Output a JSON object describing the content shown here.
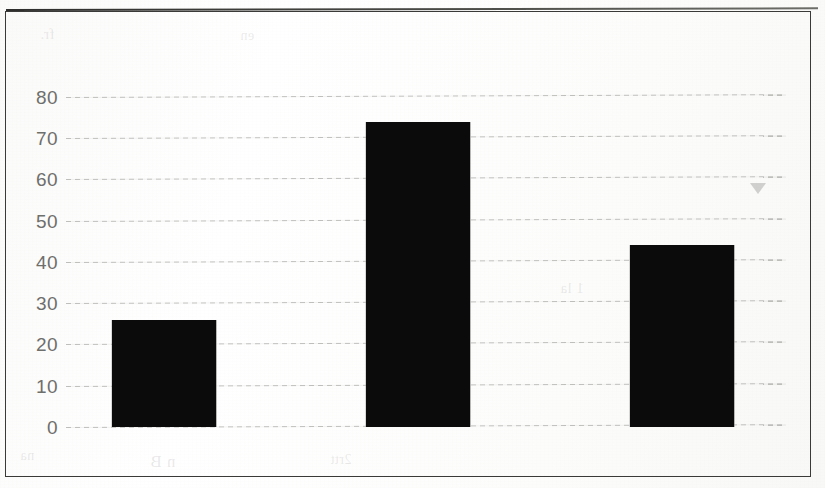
{
  "chart_data": {
    "type": "bar",
    "title": "",
    "subtitle": "",
    "xlabel": "",
    "ylabel": "",
    "categories": [
      "Myanmar (2012 -2014)",
      "Cambodia (2012 - 2014)",
      "Vietnam (2006 - 2008)"
    ],
    "values": [
      26,
      74,
      44
    ],
    "ylim": [
      0,
      80
    ],
    "y_ticks": [
      0,
      10,
      20,
      30,
      40,
      50,
      60,
      70,
      80
    ],
    "y_tick_labels": [
      "0",
      "10",
      "20",
      "30",
      "40",
      "50",
      "60",
      "70",
      "80"
    ],
    "grid": true,
    "grid_axis": "y",
    "legend": false,
    "legend_position": "none",
    "bar_color": "#0b0b0b",
    "axis_text_color": "#6f6f6c",
    "category_label_color": "#56565a",
    "gridline_color": "#8c8c88",
    "frame_color": "#3a3a38",
    "background_color": "#ffffff"
  },
  "figure": {
    "border_visible": true,
    "artifacts": {
      "triangle_marker": "triangle-artifact",
      "bleed_through_text": [
        "fr.",
        "en",
        "1 la",
        "l l",
        "n  B",
        "na",
        "2rtt"
      ]
    }
  }
}
